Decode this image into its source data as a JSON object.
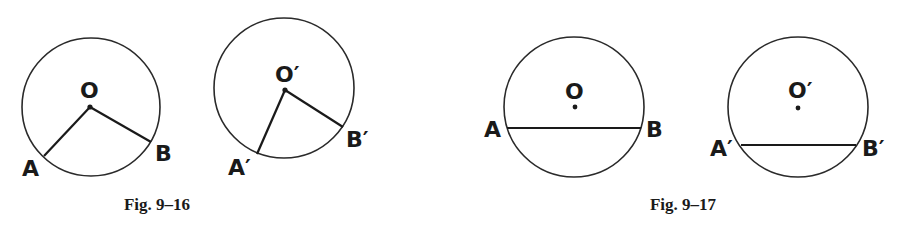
{
  "figures": [
    {
      "caption": "Fig. 9–16",
      "description": "Two circles with central angles AOB and A'O'B'",
      "circles": [
        {
          "center_label": "O",
          "point_labels": [
            "A",
            "B"
          ]
        },
        {
          "center_label": "O′",
          "point_labels": [
            "A′",
            "B′"
          ]
        }
      ]
    },
    {
      "caption": "Fig. 9–17",
      "description": "Two circles with chords AB and A'B'",
      "circles": [
        {
          "center_label": "O",
          "point_labels": [
            "A",
            "B"
          ]
        },
        {
          "center_label": "O′",
          "point_labels": [
            "A′",
            "B′"
          ]
        }
      ]
    }
  ],
  "colors": {
    "stroke": "#1a1a1a",
    "background": "#ffffff"
  }
}
